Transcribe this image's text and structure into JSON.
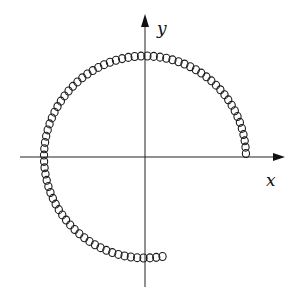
{
  "diagram": {
    "type": "circular-coil-trajectory",
    "axes": {
      "x_label": "x",
      "y_label": "y",
      "origin_px": [
        145,
        157
      ],
      "x_axis_px": [
        20,
        285
      ],
      "y_axis_px": [
        15,
        287
      ],
      "color": "#222222"
    },
    "path": {
      "description": "chain of small loops following a circle of radius ~101px from angle 0 (positive x-axis) counter-clockwise to ~280 degrees, ending just right of negative y-axis",
      "radius_px": 101,
      "start_angle_deg": 2,
      "end_angle_deg": 280,
      "loop_count": 78,
      "loop_radius_px": 3.6,
      "stroke": "#1a1a1a"
    }
  }
}
